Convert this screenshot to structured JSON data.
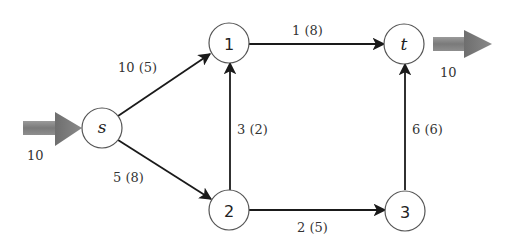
{
  "diagram": {
    "type": "flow-network",
    "nodes": [
      {
        "id": "s",
        "label": "s",
        "italic": true,
        "x": 102,
        "y": 128
      },
      {
        "id": "1",
        "label": "1",
        "italic": false,
        "x": 229,
        "y": 43
      },
      {
        "id": "t",
        "label": "t",
        "italic": true,
        "x": 404,
        "y": 44
      },
      {
        "id": "2",
        "label": "2",
        "italic": false,
        "x": 229,
        "y": 210
      },
      {
        "id": "3",
        "label": "3",
        "italic": false,
        "x": 405,
        "y": 211
      }
    ],
    "edges": [
      {
        "from": "s",
        "to": "1",
        "label": "10 (5)",
        "capacity": 10,
        "flow": 5
      },
      {
        "from": "s",
        "to": "2",
        "label": "5 (8)",
        "capacity": 5,
        "flow": 8
      },
      {
        "from": "2",
        "to": "1",
        "label": "3 (2)",
        "capacity": 3,
        "flow": 2
      },
      {
        "from": "1",
        "to": "t",
        "label": "1 (8)",
        "capacity": 1,
        "flow": 8
      },
      {
        "from": "2",
        "to": "3",
        "label": "2 (5)",
        "capacity": 2,
        "flow": 5
      },
      {
        "from": "3",
        "to": "t",
        "label": "6 (6)",
        "capacity": 6,
        "flow": 6
      }
    ],
    "source_inflow": {
      "label": "10",
      "value": 10
    },
    "sink_outflow": {
      "label": "10",
      "value": 10
    },
    "colors": {
      "node_stroke": "#555555",
      "edge": "#1a1a1a",
      "flow_arrow": "#7a7a7a",
      "text": "#333333"
    }
  }
}
